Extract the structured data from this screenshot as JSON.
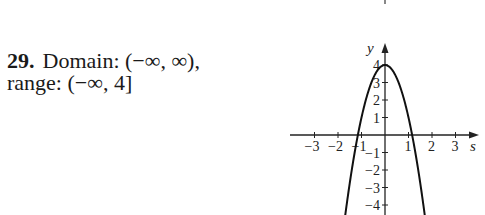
{
  "answer": {
    "number": "29.",
    "line1": "Domain: (−∞, ∞),",
    "line2": "range: (−∞, 4]"
  },
  "chart_data": {
    "type": "line",
    "title": "",
    "xlabel": "s",
    "ylabel": "y",
    "function": "y = 4 - 3s^2",
    "x_ticks": [
      -3,
      -2,
      -1,
      1,
      2,
      3
    ],
    "x_tick_labels": [
      "−3",
      "−2",
      "−1",
      "1",
      "2",
      "3"
    ],
    "y_ticks": [
      -4,
      -3,
      -2,
      -1,
      1,
      2,
      3,
      4
    ],
    "y_tick_labels": [
      "−4",
      "−3",
      "−2",
      "−1",
      "1",
      "2",
      "3",
      "4"
    ],
    "xlim": [
      -4,
      4
    ],
    "ylim": [
      -4.6,
      5
    ],
    "grid": false,
    "legend": null,
    "vertex": [
      0,
      4
    ],
    "x_intercepts": [
      -1.15,
      1.15
    ],
    "series": [
      {
        "name": "parabola",
        "x": [
          -1.7,
          -1.5,
          -1.25,
          -1.0,
          -0.75,
          -0.5,
          -0.25,
          0,
          0.25,
          0.5,
          0.75,
          1.0,
          1.25,
          1.5,
          1.75
        ],
        "values": [
          -4.67,
          -2.75,
          -0.69,
          1.0,
          2.31,
          3.25,
          3.81,
          4.0,
          3.81,
          3.25,
          2.31,
          1.0,
          -0.69,
          -2.75,
          -5.19
        ]
      }
    ],
    "colors": {
      "curve": "#111111",
      "axes": "#222222"
    }
  }
}
